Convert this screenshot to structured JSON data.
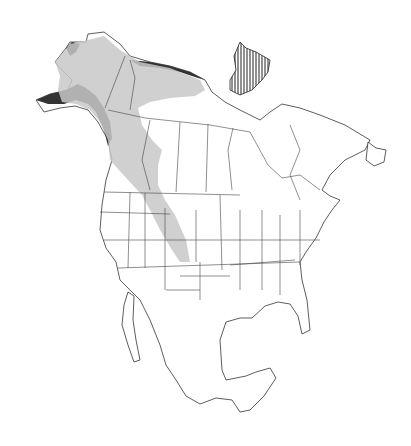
{
  "map": {
    "region": "North America",
    "legend": [],
    "colors": {
      "range_fill": "#c8c8c8",
      "breeding_hatch": "#222222",
      "outline": "#333333",
      "background": "#ffffff"
    }
  }
}
